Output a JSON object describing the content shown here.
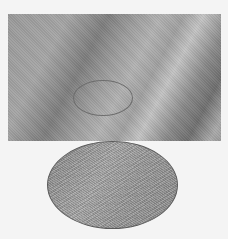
{
  "figure": {
    "main_image": {
      "type": "grayscale-texture",
      "colors": {
        "light": "#c3c3c3",
        "mid": "#9a9a9a",
        "dark": "#6f6f6f"
      }
    },
    "region_of_interest": {
      "shape": "ellipse",
      "outline_color": "#6e6e6e"
    },
    "magnified_inset": {
      "shape": "ellipse",
      "texture": "fine-diagonal-weave",
      "border_color": "#5a5a5a"
    },
    "background_color": "#f4f4f4"
  }
}
